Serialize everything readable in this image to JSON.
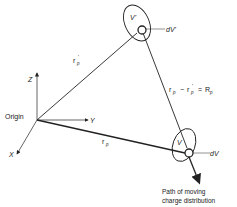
{
  "diagram": {
    "labels": {
      "origin": "Origin",
      "axis_x": "X",
      "axis_y": "Y",
      "axis_z": "Z",
      "volume_source": "V'",
      "volume_field": "V",
      "element_source": "dV'",
      "element_field": "dV",
      "vector_source": "r",
      "vector_source_sub": "p",
      "vector_source_prime": "'",
      "vector_field": "r",
      "vector_field_sub": "p",
      "difference_eq": "r  − r ' = R",
      "diff_r1": "r",
      "diff_s1": "p",
      "diff_minus": "−",
      "diff_r2": "r",
      "diff_s2": "p",
      "diff_prime": "'",
      "diff_eq": "=",
      "diff_R": "R",
      "diff_s3": "p",
      "path_line1": "Path of moving",
      "path_line2": "charge distribution"
    },
    "colors": {
      "stroke": "#222222",
      "background": "#ffffff"
    }
  }
}
